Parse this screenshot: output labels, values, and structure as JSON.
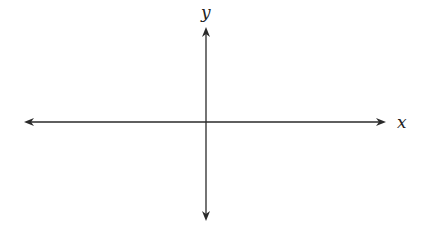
{
  "diagram": {
    "type": "coordinate-axes",
    "x_axis": {
      "label": "x",
      "direction": "bidirectional"
    },
    "y_axis": {
      "label": "y",
      "direction": "bidirectional"
    },
    "colors": {
      "line": "#2a2a2a",
      "background": "#ffffff"
    }
  }
}
